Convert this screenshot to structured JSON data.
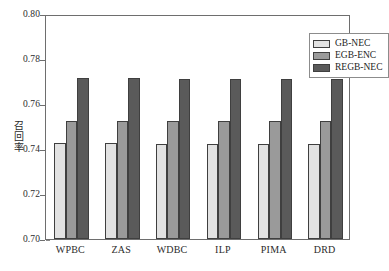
{
  "chart_data": {
    "type": "bar",
    "title": "",
    "xlabel": "",
    "ylabel": "召回率",
    "ylim": [
      0.7,
      0.8
    ],
    "ytick_labels": [
      "0.70",
      "0.72",
      "0.74",
      "0.76",
      "0.78",
      "0.80"
    ],
    "ytick_values": [
      0.7,
      0.72,
      0.74,
      0.76,
      0.78,
      0.8
    ],
    "grid": false,
    "legend_position": "top-right",
    "categories": [
      "WPBC",
      "ZAS",
      "WDBC",
      "ILP",
      "PIMA",
      "DRD"
    ],
    "series": [
      {
        "name": "GB-NEC",
        "color": "#e2e2e2",
        "values": [
          0.7425,
          0.7425,
          0.7424,
          0.7424,
          0.7423,
          0.7423
        ]
      },
      {
        "name": "EGB-ENC",
        "color": "#9a9a9a",
        "values": [
          0.7525,
          0.7525,
          0.7524,
          0.7524,
          0.7524,
          0.7524
        ]
      },
      {
        "name": "REGB-NEC",
        "color": "#5a5a5a",
        "values": [
          0.7715,
          0.7715,
          0.7713,
          0.7713,
          0.7712,
          0.771
        ]
      }
    ]
  },
  "legend": {
    "entries": [
      {
        "label": "GB-NEC",
        "swatch": "legend-swatch-gb-nec"
      },
      {
        "label": "EGB-ENC",
        "swatch": "legend-swatch-egb-enc"
      },
      {
        "label": "REGB-NEC",
        "swatch": "legend-swatch-regb-nec"
      }
    ]
  },
  "axes": {
    "y_title": "召回率"
  }
}
